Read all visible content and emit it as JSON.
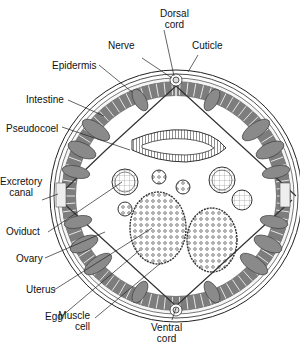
{
  "diagram": {
    "labels": {
      "dorsal_cord": {
        "line1": "Dorsal",
        "line2": "cord"
      },
      "nerve": "Nerve",
      "cuticle": "Cuticle",
      "epidermis": "Epidermis",
      "intestine": "Intestine",
      "pseudocoel": "Pseudocoel",
      "excretory_canal": {
        "line1": "Excretory",
        "line2": "canal"
      },
      "oviduct": "Oviduct",
      "ovary": "Ovary",
      "uterus": "Uterus",
      "egg": "Egg",
      "muscle_cell": {
        "line1": "Muscle",
        "line2": "cell"
      },
      "ventral_cord": {
        "line1": "Ventral",
        "line2": "cord"
      }
    },
    "colors": {
      "ink": "#222222",
      "muscle_fill": "#8a8a8a",
      "muscle_dark": "#5a5a5a",
      "background": "#ffffff"
    }
  }
}
